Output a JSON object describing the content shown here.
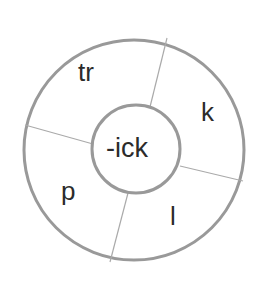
{
  "diagram": {
    "type": "word-family-wheel",
    "center": {
      "id": "center-rime",
      "text": "-ick"
    },
    "colors": {
      "background": "#ffffff",
      "outer_circle_stroke": "#999999",
      "inner_circle_stroke": "#999999",
      "divider_stroke": "#aaaaaa",
      "label_text": "#2b2b2b"
    },
    "geometry": {
      "outer_circle": {
        "cx": 134,
        "cy": 150,
        "r": 110,
        "stroke_width": 3
      },
      "inner_circle": {
        "cx": 136,
        "cy": 149,
        "r": 44,
        "stroke_width": 3
      },
      "dividers": [
        {
          "id": "divider-top-right",
          "x1": 150,
          "y1": 107,
          "x2": 167,
          "y2": 38
        },
        {
          "id": "divider-left",
          "x1": 93,
          "y1": 144,
          "x2": 25,
          "y2": 125
        },
        {
          "id": "divider-right",
          "x1": 180,
          "y1": 166,
          "x2": 243,
          "y2": 181
        },
        {
          "id": "divider-bottom",
          "x1": 128,
          "y1": 193,
          "x2": 110,
          "y2": 262
        }
      ]
    },
    "segments": [
      {
        "id": "segment-tr",
        "label": "tr",
        "position": "top-left",
        "word": "trick"
      },
      {
        "id": "segment-k",
        "label": "k",
        "position": "right",
        "word": "kick"
      },
      {
        "id": "segment-l",
        "label": "l",
        "position": "bottom-right",
        "word": "lick"
      },
      {
        "id": "segment-p",
        "label": "p",
        "position": "bottom-left",
        "word": "pick"
      }
    ]
  }
}
